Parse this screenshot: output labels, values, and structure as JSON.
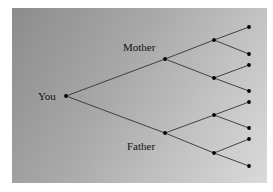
{
  "diagram": {
    "type": "family-tree",
    "labels": {
      "root": "You",
      "upper": "Mother",
      "lower": "Father"
    },
    "colors": {
      "line": "#333333",
      "node": "#000000",
      "panel_dark": "#8c8c8c",
      "panel_light": "#dadada"
    },
    "nodes": {
      "root": [
        66,
        96
      ],
      "level1": [
        [
          165,
          59
        ],
        [
          165,
          133
        ]
      ],
      "level2": [
        [
          214,
          40
        ],
        [
          214,
          78
        ],
        [
          214,
          115
        ],
        [
          214,
          153
        ]
      ],
      "level3": [
        [
          249,
          27
        ],
        [
          249,
          54
        ],
        [
          249,
          65
        ],
        [
          249,
          91
        ],
        [
          249,
          102
        ],
        [
          249,
          128
        ],
        [
          249,
          139
        ],
        [
          249,
          166
        ]
      ]
    }
  }
}
